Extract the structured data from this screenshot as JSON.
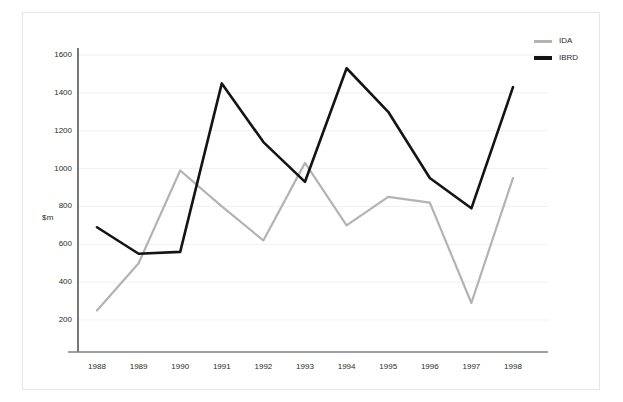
{
  "chart_data": {
    "type": "line",
    "title": "",
    "xlabel": "",
    "ylabel": "$m",
    "categories": [
      "1988",
      "1989",
      "1990",
      "1991",
      "1992",
      "1993",
      "1994",
      "1995",
      "1996",
      "1997",
      "1998"
    ],
    "ylim": [
      0,
      1700
    ],
    "yticks": [
      200,
      400,
      600,
      800,
      1000,
      1200,
      1400,
      1600
    ],
    "ytick_labels": [
      "200",
      "400",
      "600",
      "800",
      "1000",
      "1200",
      "1400",
      "1600"
    ],
    "grid": "horizontal",
    "legend_position": "top-right",
    "series": [
      {
        "name": "IDA",
        "color": "#b3b3b3",
        "values": [
          250,
          500,
          990,
          800,
          620,
          1030,
          700,
          850,
          820,
          290,
          950
        ]
      },
      {
        "name": "IBRD",
        "color": "#141414",
        "values": [
          690,
          550,
          560,
          1450,
          1140,
          930,
          1530,
          1300,
          950,
          790,
          1430
        ]
      }
    ]
  },
  "axes": {
    "y_axis_label": "$m",
    "y_axis_color": "#3d3d3d",
    "x_axis_color": "#808080",
    "gridline_color": "#f0f0f0"
  },
  "legend": {
    "items": [
      {
        "label": "IDA",
        "color": "#b3b3b3"
      },
      {
        "label": "IBRD",
        "color": "#141414"
      }
    ]
  },
  "frame": {
    "border_color": "#e6e6e6"
  }
}
